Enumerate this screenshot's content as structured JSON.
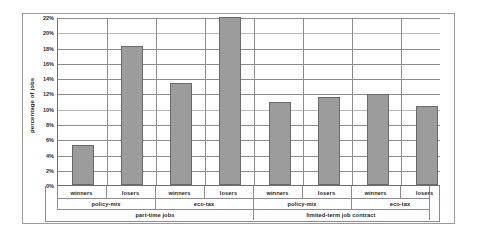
{
  "chart_data": {
    "type": "bar",
    "title": "",
    "xlabel": "",
    "ylabel": "percentage of jobs",
    "ylim": [
      0,
      22
    ],
    "grid": true,
    "legend": "none",
    "ytick_labels": [
      "0%",
      "2%",
      "4%",
      "6%",
      "8%",
      "10%",
      "12%",
      "14%",
      "16%",
      "18%",
      "20%",
      "22%"
    ],
    "ytick_values": [
      0,
      2,
      4,
      6,
      8,
      10,
      12,
      14,
      16,
      18,
      20,
      22
    ],
    "categories": [
      "winners",
      "losers",
      "winners",
      "losers",
      "winners",
      "losers",
      "winners",
      "losers"
    ],
    "values": [
      5.3,
      18.3,
      13.5,
      22.1,
      10.9,
      11.6,
      12.05,
      10.35
    ],
    "group_level_2": [
      {
        "label": "policy-mix",
        "span": 2
      },
      {
        "label": "eco-tax",
        "span": 2
      },
      {
        "label": "policy-mix",
        "span": 2
      },
      {
        "label": "eco-tax",
        "span": 2
      }
    ],
    "group_level_3": [
      {
        "label": "part-time jobs",
        "span": 4
      },
      {
        "label": "limited-term job contract",
        "span": 4
      }
    ],
    "series": [
      {
        "name": "percentage of jobs",
        "values": [
          5.3,
          18.3,
          13.5,
          22.1,
          10.9,
          11.6,
          12.05,
          10.35
        ]
      }
    ],
    "colors": {
      "bar_fill": "#9c9c9c",
      "bar_border": "#6a6a6a",
      "gridline": "#8c8c8c",
      "axis": "#6e6e6e",
      "frame": "#9a9a9a",
      "text": "#1f1f1f",
      "background": "#ffffff"
    }
  },
  "axis": {
    "y_title": "percentage of jobs"
  },
  "ticks": {
    "y": [
      "22%",
      "20%",
      "18%",
      "16%",
      "14%",
      "12%",
      "10%",
      "8%",
      "6%",
      "4%",
      "2%",
      "0%"
    ]
  },
  "bar_labels": [
    "winners",
    "losers",
    "winners",
    "losers",
    "winners",
    "losers",
    "winners",
    "losers"
  ],
  "sub_groups": [
    "policy-mix",
    "eco-tax",
    "policy-mix",
    "eco-tax"
  ],
  "top_groups": [
    "part-time jobs",
    "limited-term job contract"
  ]
}
